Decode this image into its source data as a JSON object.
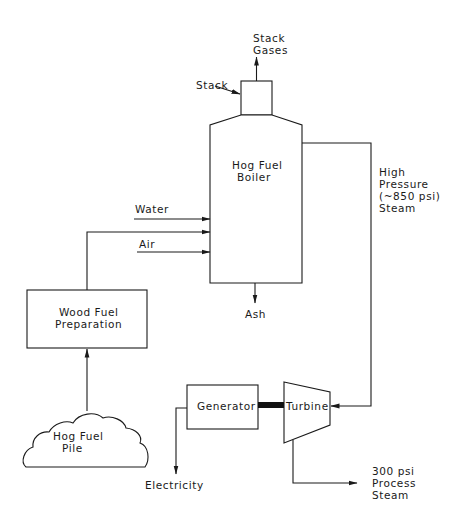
{
  "diagram": {
    "nodes": {
      "stack_gases": {
        "line1": "Stack",
        "line2": "Gases"
      },
      "stack": {
        "label": "Stack"
      },
      "boiler": {
        "line1": "Hog Fuel",
        "line2": "Boiler"
      },
      "water": {
        "label": "Water"
      },
      "air": {
        "label": "Air"
      },
      "ash": {
        "label": "Ash"
      },
      "steam_hp": {
        "line1": "High",
        "line2": "Pressure",
        "line3": "(~850 psi)",
        "line4": "Steam"
      },
      "wood_prep": {
        "line1": "Wood Fuel",
        "line2": "Preparation"
      },
      "hog_pile": {
        "line1": "Hog Fuel",
        "line2": "Pile"
      },
      "generator": {
        "label": "Generator"
      },
      "turbine": {
        "label": "Turbine"
      },
      "electricity": {
        "label": "Electricity"
      },
      "process_steam": {
        "line1": "300 psi",
        "line2": "Process",
        "line3": "Steam"
      }
    },
    "edges": [
      {
        "from": "hog_pile",
        "to": "wood_prep"
      },
      {
        "from": "wood_prep",
        "to": "boiler"
      },
      {
        "from": "water",
        "to": "boiler"
      },
      {
        "from": "air",
        "to": "boiler"
      },
      {
        "from": "boiler",
        "to": "ash"
      },
      {
        "from": "stack",
        "to": "stack_gases"
      },
      {
        "from": "boiler",
        "to": "turbine",
        "label": "High Pressure (~850 psi) Steam"
      },
      {
        "from": "turbine",
        "to": "generator",
        "type": "shaft"
      },
      {
        "from": "generator",
        "to": "electricity"
      },
      {
        "from": "turbine",
        "to": "process_steam"
      }
    ]
  }
}
